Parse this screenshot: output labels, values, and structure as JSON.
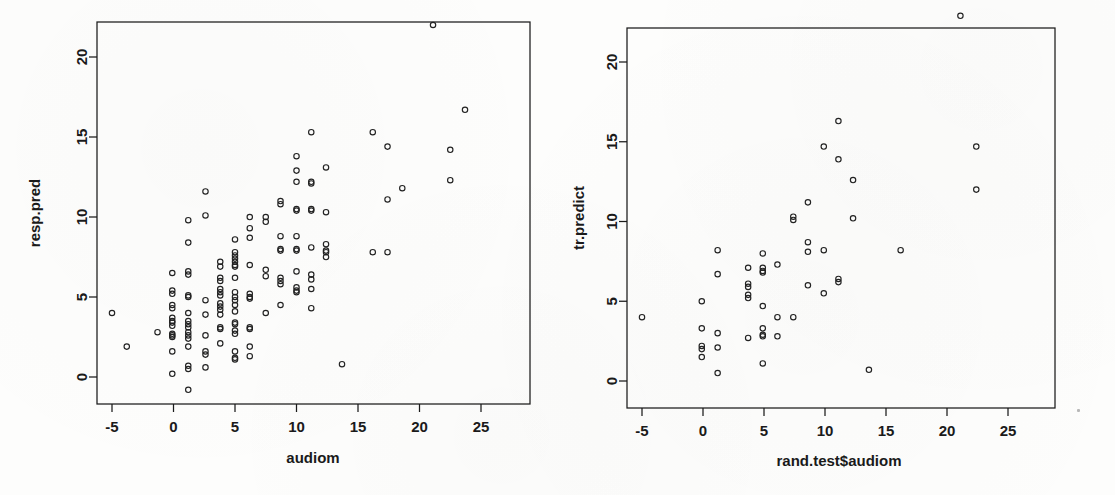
{
  "figure": {
    "background_color": "#fdfdfc",
    "ink_color": "#1a1a1a",
    "point_color": "#222222",
    "panel_count": 2
  },
  "chart_data": [
    {
      "type": "scatter",
      "panel": "left",
      "title": "",
      "xlabel": "audiom",
      "ylabel": "resp.pred",
      "xlim": [
        -7.2,
        27.6
      ],
      "ylim": [
        -2.2,
        23.2
      ],
      "xticks": [
        -5,
        0,
        5,
        10,
        15,
        20,
        25
      ],
      "xticklabels": [
        "-5",
        "0",
        "5",
        "10",
        "15",
        "20",
        "25"
      ],
      "yticks": [
        0,
        5,
        10,
        15,
        20
      ],
      "yticklabels": [
        "0",
        "5",
        "10",
        "15",
        "20"
      ],
      "grid": false,
      "legend": null,
      "marker": "open-circle",
      "marker_size": 5.4,
      "points": [
        [
          -5.0,
          4.0
        ],
        [
          -3.8,
          1.9
        ],
        [
          -1.3,
          2.8
        ],
        [
          -0.1,
          6.5
        ],
        [
          -0.1,
          5.4
        ],
        [
          -0.1,
          5.2
        ],
        [
          -0.1,
          4.5
        ],
        [
          -0.1,
          4.3
        ],
        [
          -0.1,
          3.7
        ],
        [
          -0.1,
          3.5
        ],
        [
          -0.1,
          3.4
        ],
        [
          -0.1,
          3.2
        ],
        [
          -0.1,
          2.7
        ],
        [
          -0.1,
          2.6
        ],
        [
          -0.1,
          2.5
        ],
        [
          -0.1,
          1.6
        ],
        [
          -0.1,
          0.2
        ],
        [
          1.2,
          9.8
        ],
        [
          1.2,
          8.4
        ],
        [
          1.2,
          6.6
        ],
        [
          1.2,
          6.4
        ],
        [
          1.2,
          5.1
        ],
        [
          1.2,
          5.0
        ],
        [
          1.2,
          4.0
        ],
        [
          1.2,
          3.5
        ],
        [
          1.2,
          3.3
        ],
        [
          1.2,
          3.1
        ],
        [
          1.2,
          2.8
        ],
        [
          1.2,
          2.6
        ],
        [
          1.2,
          2.4
        ],
        [
          1.2,
          1.9
        ],
        [
          1.2,
          0.7
        ],
        [
          1.2,
          0.5
        ],
        [
          1.2,
          -0.8
        ],
        [
          2.6,
          11.6
        ],
        [
          2.6,
          10.1
        ],
        [
          2.6,
          4.8
        ],
        [
          2.6,
          3.9
        ],
        [
          2.6,
          2.6
        ],
        [
          2.6,
          1.6
        ],
        [
          2.6,
          1.4
        ],
        [
          2.6,
          0.6
        ],
        [
          3.8,
          7.2
        ],
        [
          3.8,
          6.9
        ],
        [
          3.8,
          6.2
        ],
        [
          3.8,
          6.0
        ],
        [
          3.8,
          5.5
        ],
        [
          3.8,
          5.3
        ],
        [
          3.8,
          5.1
        ],
        [
          3.8,
          4.6
        ],
        [
          3.8,
          4.4
        ],
        [
          3.8,
          4.2
        ],
        [
          3.8,
          3.9
        ],
        [
          3.8,
          3.1
        ],
        [
          3.8,
          3.0
        ],
        [
          3.8,
          2.1
        ],
        [
          5.0,
          8.6
        ],
        [
          5.0,
          7.8
        ],
        [
          5.0,
          7.6
        ],
        [
          5.0,
          7.4
        ],
        [
          5.0,
          7.2
        ],
        [
          5.0,
          7.0
        ],
        [
          5.0,
          6.9
        ],
        [
          5.0,
          6.2
        ],
        [
          5.0,
          5.3
        ],
        [
          5.0,
          5.0
        ],
        [
          5.0,
          4.8
        ],
        [
          5.0,
          4.5
        ],
        [
          5.0,
          4.1
        ],
        [
          5.0,
          3.4
        ],
        [
          5.0,
          3.3
        ],
        [
          5.0,
          2.9
        ],
        [
          5.0,
          2.7
        ],
        [
          5.0,
          1.6
        ],
        [
          5.0,
          1.2
        ],
        [
          5.0,
          1.1
        ],
        [
          6.2,
          10.0
        ],
        [
          6.2,
          9.3
        ],
        [
          6.2,
          8.7
        ],
        [
          6.2,
          7.0
        ],
        [
          6.2,
          5.2
        ],
        [
          6.2,
          5.0
        ],
        [
          6.2,
          4.9
        ],
        [
          6.2,
          3.1
        ],
        [
          6.2,
          3.0
        ],
        [
          6.2,
          1.9
        ],
        [
          6.2,
          1.3
        ],
        [
          7.5,
          10.0
        ],
        [
          7.5,
          9.7
        ],
        [
          7.5,
          6.7
        ],
        [
          7.5,
          6.3
        ],
        [
          7.5,
          4.0
        ],
        [
          8.7,
          11.0
        ],
        [
          8.7,
          10.8
        ],
        [
          8.7,
          8.8
        ],
        [
          8.7,
          8.0
        ],
        [
          8.7,
          7.9
        ],
        [
          8.7,
          6.2
        ],
        [
          8.7,
          6.0
        ],
        [
          8.7,
          5.8
        ],
        [
          8.7,
          4.5
        ],
        [
          10.0,
          13.8
        ],
        [
          10.0,
          12.9
        ],
        [
          10.0,
          12.2
        ],
        [
          10.0,
          10.5
        ],
        [
          10.0,
          10.4
        ],
        [
          10.0,
          8.8
        ],
        [
          10.0,
          8.0
        ],
        [
          10.0,
          7.9
        ],
        [
          10.0,
          6.6
        ],
        [
          10.0,
          5.6
        ],
        [
          10.0,
          5.4
        ],
        [
          10.0,
          5.3
        ],
        [
          11.2,
          15.3
        ],
        [
          11.2,
          12.2
        ],
        [
          11.2,
          12.1
        ],
        [
          11.2,
          10.5
        ],
        [
          11.2,
          10.4
        ],
        [
          11.2,
          8.1
        ],
        [
          11.2,
          6.4
        ],
        [
          11.2,
          6.1
        ],
        [
          11.2,
          5.5
        ],
        [
          11.2,
          4.3
        ],
        [
          12.4,
          13.1
        ],
        [
          12.4,
          10.3
        ],
        [
          12.4,
          8.3
        ],
        [
          12.4,
          7.9
        ],
        [
          12.4,
          7.5
        ],
        [
          12.4,
          7.8
        ],
        [
          13.7,
          0.8
        ],
        [
          16.2,
          15.3
        ],
        [
          16.2,
          7.8
        ],
        [
          17.4,
          14.4
        ],
        [
          17.4,
          11.1
        ],
        [
          17.4,
          7.8
        ],
        [
          18.6,
          11.8
        ],
        [
          21.1,
          22.0
        ],
        [
          22.5,
          14.2
        ],
        [
          22.5,
          12.3
        ],
        [
          23.7,
          16.7
        ]
      ]
    },
    {
      "type": "scatter",
      "panel": "right",
      "title": "",
      "xlabel": "rand.test$audiom",
      "ylabel": "tr.predict",
      "xlim": [
        -7.2,
        27.6
      ],
      "ylim": [
        -1.1,
        23.8
      ],
      "xticks": [
        -5,
        0,
        5,
        10,
        15,
        20,
        25
      ],
      "xticklabels": [
        "-5",
        "0",
        "5",
        "10",
        "15",
        "20",
        "25"
      ],
      "yticks": [
        0,
        5,
        10,
        15,
        20
      ],
      "yticklabels": [
        "0",
        "5",
        "10",
        "15",
        "20"
      ],
      "grid": false,
      "legend": null,
      "marker": "open-circle",
      "marker_size": 5.4,
      "points": [
        [
          -5.0,
          4.0
        ],
        [
          -0.1,
          5.0
        ],
        [
          -0.1,
          3.3
        ],
        [
          -0.1,
          2.2
        ],
        [
          -0.1,
          2.0
        ],
        [
          -0.1,
          1.5
        ],
        [
          1.2,
          8.2
        ],
        [
          1.2,
          6.7
        ],
        [
          1.2,
          3.0
        ],
        [
          1.2,
          2.1
        ],
        [
          1.2,
          0.5
        ],
        [
          3.7,
          7.1
        ],
        [
          3.7,
          6.1
        ],
        [
          3.7,
          5.9
        ],
        [
          3.7,
          5.4
        ],
        [
          3.7,
          5.2
        ],
        [
          3.7,
          2.7
        ],
        [
          4.9,
          8.0
        ],
        [
          4.9,
          7.1
        ],
        [
          4.9,
          6.9
        ],
        [
          4.9,
          6.8
        ],
        [
          4.9,
          4.7
        ],
        [
          4.9,
          3.3
        ],
        [
          4.9,
          2.9
        ],
        [
          4.9,
          2.8
        ],
        [
          4.9,
          1.1
        ],
        [
          6.1,
          7.3
        ],
        [
          6.1,
          4.0
        ],
        [
          6.1,
          2.8
        ],
        [
          7.4,
          10.3
        ],
        [
          7.4,
          10.1
        ],
        [
          7.4,
          4.0
        ],
        [
          8.6,
          11.2
        ],
        [
          8.6,
          8.7
        ],
        [
          8.6,
          8.1
        ],
        [
          8.6,
          6.0
        ],
        [
          9.9,
          14.7
        ],
        [
          9.9,
          8.2
        ],
        [
          9.9,
          5.5
        ],
        [
          11.1,
          16.3
        ],
        [
          11.1,
          13.9
        ],
        [
          11.1,
          6.4
        ],
        [
          11.1,
          6.2
        ],
        [
          12.3,
          12.6
        ],
        [
          12.3,
          10.2
        ],
        [
          13.6,
          0.7
        ],
        [
          16.2,
          8.2
        ],
        [
          21.1,
          22.9
        ],
        [
          22.4,
          14.7
        ],
        [
          22.4,
          12.0
        ]
      ]
    }
  ]
}
